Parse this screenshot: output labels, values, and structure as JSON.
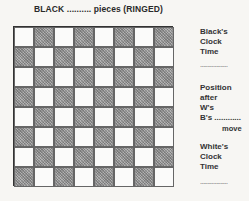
{
  "header": {
    "title": "BLACK .......... pieces (RINGED)"
  },
  "board": {
    "rows": 8,
    "cols": 8,
    "top_left_color": "light",
    "light_color": "#fbfbfa",
    "dark_color": "#9a9a9a"
  },
  "side_panel": {
    "black_clock": {
      "line1": "Black's",
      "line2": "Clock",
      "line3": "Time",
      "blank": "..................."
    },
    "position": {
      "line1": "Position",
      "line2": "after",
      "line3": "W's",
      "line4": "B's ............",
      "move": "move"
    },
    "white_clock": {
      "line1": "White's",
      "line2": "Clock",
      "line3": "Time",
      "blank": "..................."
    }
  }
}
